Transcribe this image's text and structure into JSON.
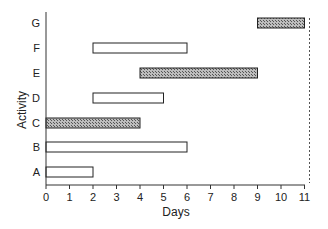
{
  "chart_data": {
    "type": "gantt",
    "title": "",
    "xlabel": "Days",
    "ylabel": "Activity",
    "xlim": [
      0,
      11
    ],
    "xticks": [
      0,
      1,
      2,
      3,
      4,
      5,
      6,
      7,
      8,
      9,
      10,
      11
    ],
    "categories": [
      "A",
      "B",
      "C",
      "D",
      "E",
      "F",
      "G"
    ],
    "tasks": [
      {
        "activity": "A",
        "start": 0,
        "end": 2,
        "critical": false
      },
      {
        "activity": "B",
        "start": 0,
        "end": 6,
        "critical": false
      },
      {
        "activity": "C",
        "start": 0,
        "end": 4,
        "critical": true
      },
      {
        "activity": "D",
        "start": 2,
        "end": 5,
        "critical": false
      },
      {
        "activity": "E",
        "start": 4,
        "end": 9,
        "critical": true
      },
      {
        "activity": "F",
        "start": 2,
        "end": 6,
        "critical": false
      },
      {
        "activity": "G",
        "start": 9,
        "end": 11,
        "critical": true
      }
    ],
    "reference_line": {
      "x": 11,
      "style": "dashed"
    },
    "legend": "none",
    "grid": false
  },
  "colors": {
    "axis": "#333333",
    "bar_open": "#ffffff",
    "bar_critical": "#999999",
    "bar_edge": "#222222"
  }
}
